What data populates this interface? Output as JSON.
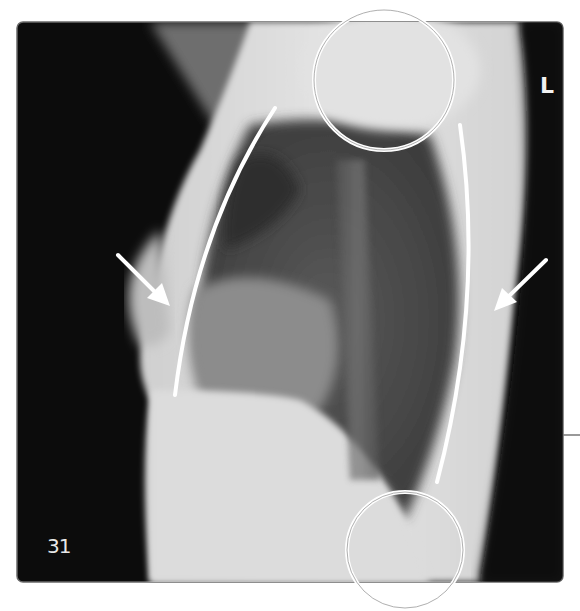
{
  "figure": {
    "type": "lateral chest radiograph",
    "figure_number": "31",
    "side_marker": "L",
    "annotations": {
      "circles": [
        {
          "name": "upper-circle",
          "cx": 384,
          "cy": 80,
          "r": 70
        },
        {
          "name": "lower-circle",
          "cx": 405,
          "cy": 550,
          "r": 58
        }
      ],
      "curves": [
        {
          "name": "anterior-curve",
          "from": [
            275,
            108
          ],
          "to": [
            175,
            395
          ]
        },
        {
          "name": "posterior-curve",
          "from": [
            460,
            125
          ],
          "to": [
            437,
            482
          ]
        }
      ],
      "arrows": [
        {
          "name": "left-arrow",
          "from": [
            118,
            255
          ],
          "to": [
            168,
            305
          ]
        },
        {
          "name": "right-arrow",
          "from": [
            546,
            260
          ],
          "to": [
            495,
            310
          ]
        }
      ]
    },
    "colors": {
      "background": "#ffffff",
      "film_dark": "#0c0c0c",
      "soft_tissue": "#d9d9d9",
      "lung": "#4a4a4a",
      "annotation": "#ffffff"
    }
  }
}
